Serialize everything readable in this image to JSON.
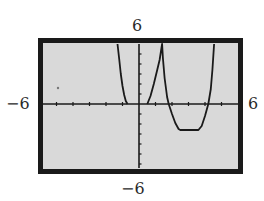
{
  "labels": {
    "ymax": "6",
    "ymin": "−6",
    "xmin": "−6",
    "xmax": "6"
  },
  "colors": {
    "screen_bg": "#d9d9d9",
    "frame": "#1a1a1a",
    "curve": "#1a1a1a",
    "axis": "#1a1a1a"
  },
  "chart_data": {
    "type": "line",
    "title": "",
    "xlabel": "",
    "ylabel": "",
    "xlim": [
      -6,
      6
    ],
    "ylim": [
      -6,
      6
    ],
    "xscl": 1,
    "yscl": 1,
    "grid": false,
    "legend": null,
    "annotations": [
      "Graphing calculator viewing window: Xmin=-6, Xmax=6, Ymin=-6, Ymax=6"
    ],
    "series": [
      {
        "name": "y = f(x)",
        "points": [
          [
            -1.3,
            6.0
          ],
          [
            -1.2,
            4.5
          ],
          [
            -1.1,
            3.0
          ],
          [
            -1.0,
            1.8
          ],
          [
            -0.9,
            0.9
          ],
          [
            -0.8,
            0.3
          ],
          [
            -0.7,
            0.0
          ],
          [
            0.5,
            0.0
          ],
          [
            0.7,
            0.8
          ],
          [
            0.9,
            2.0
          ],
          [
            1.1,
            3.4
          ],
          [
            1.25,
            4.4
          ],
          [
            1.4,
            6.0
          ],
          [
            1.45,
            4.6
          ],
          [
            1.55,
            2.6
          ],
          [
            1.7,
            0.7
          ],
          [
            1.8,
            0.0
          ],
          [
            2.0,
            -1.0
          ],
          [
            2.2,
            -1.9
          ],
          [
            2.4,
            -2.5
          ],
          [
            2.5,
            -2.6
          ],
          [
            3.0,
            -2.6
          ],
          [
            3.6,
            -2.6
          ],
          [
            3.8,
            -2.2
          ],
          [
            4.0,
            -1.2
          ],
          [
            4.2,
            0.0
          ],
          [
            4.35,
            1.5
          ],
          [
            4.45,
            3.4
          ],
          [
            4.55,
            6.0
          ]
        ]
      }
    ]
  }
}
